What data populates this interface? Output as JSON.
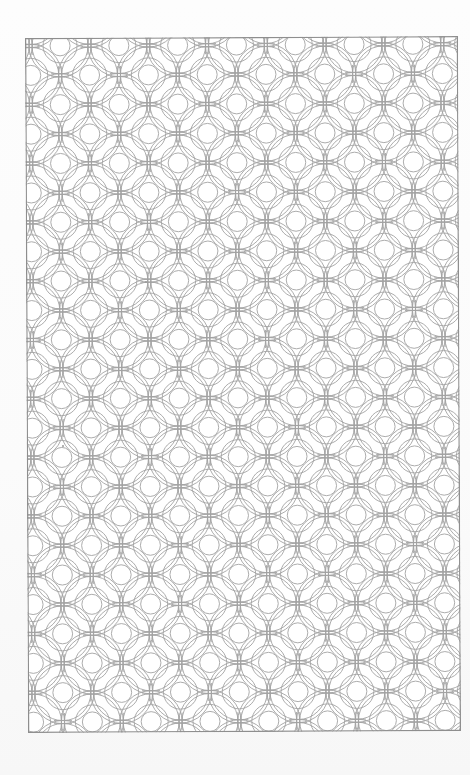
{
  "page": {
    "type": "coloring-book page",
    "background_color": "#fbfbfb",
    "line_color": "#a3a3a3",
    "frame_color": "#8e8e8e"
  },
  "pattern": {
    "name": "overlapping-circles-lattice",
    "motif": "small circle surrounded by concentric overlapping ring arcs forming cross junctions",
    "period_px": 58.8,
    "inner_circle_radius_px": 10,
    "ring_radii_px": [
      17,
      28,
      31
    ],
    "stagger": "half-period offset rows",
    "columns_visible": 7.4,
    "rows_visible": 11.8
  },
  "frame": {
    "left": 25,
    "top": 38,
    "width": 433,
    "height": 695
  },
  "marks": [
    {
      "x": 62,
      "y": 445
    },
    {
      "x": 145,
      "y": 281
    }
  ]
}
